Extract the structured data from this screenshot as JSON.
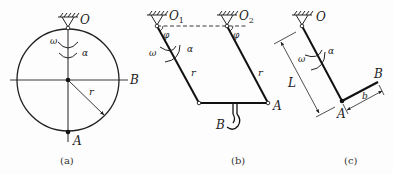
{
  "figure": {
    "panels": [
      {
        "id": "a",
        "caption": "(a)",
        "labels": {
          "pivot": "O",
          "bottom": "A",
          "right": "B",
          "radius": "r",
          "omega": "ω",
          "alpha": "α"
        },
        "description": "Disk of radius r pinned at O on its rim, rotating with angular velocity ω and angular acceleration α"
      },
      {
        "id": "b",
        "caption": "(b)",
        "labels": {
          "pivot1": "O",
          "pivot1_sub": "1",
          "pivot2": "O",
          "pivot2_sub": "2",
          "angle1": "φ",
          "angle2": "φ",
          "omega": "ω",
          "alpha": "α",
          "link1": "r",
          "link2": "r",
          "joint": "A",
          "hook": "B"
        },
        "description": "Parallelogram four-bar linkage with cranks O1 and O2 of length r, carrying a hook B"
      },
      {
        "id": "c",
        "caption": "(c)",
        "labels": {
          "pivot": "O",
          "length": "L",
          "joint": "A",
          "end": "B",
          "arm": "b",
          "omega": "ω",
          "alpha": "α"
        },
        "description": "Bar OA of length L pinned at O with rigidly attached arm AB of length b"
      }
    ]
  }
}
